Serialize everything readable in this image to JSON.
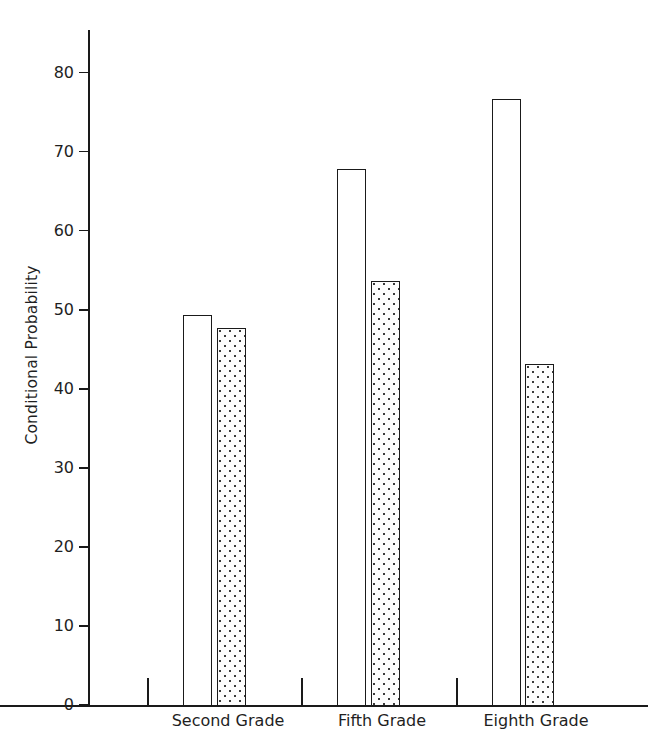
{
  "chart_data": {
    "type": "bar",
    "title": "",
    "xlabel": "",
    "ylabel": "Conditional Probability",
    "categories": [
      "Second Grade",
      "Fifth Grade",
      "Eighth Grade"
    ],
    "ylim": [
      0,
      84
    ],
    "yticks": [
      0,
      10,
      20,
      30,
      40,
      50,
      60,
      70,
      80
    ],
    "ytick_labels": [
      "0",
      "10",
      "20",
      "30",
      "40",
      "50",
      "60",
      "70",
      "80"
    ],
    "grid": false,
    "legend": "none",
    "series": [
      {
        "name": "open-bar",
        "style": "white-outline",
        "values": [
          49.3,
          67.8,
          76.7
        ]
      },
      {
        "name": "stippled-bar",
        "style": "dotted-fill",
        "values": [
          47.7,
          53.7,
          43.2
        ]
      }
    ]
  },
  "axis": {
    "ylabel": "Conditional Probability"
  }
}
